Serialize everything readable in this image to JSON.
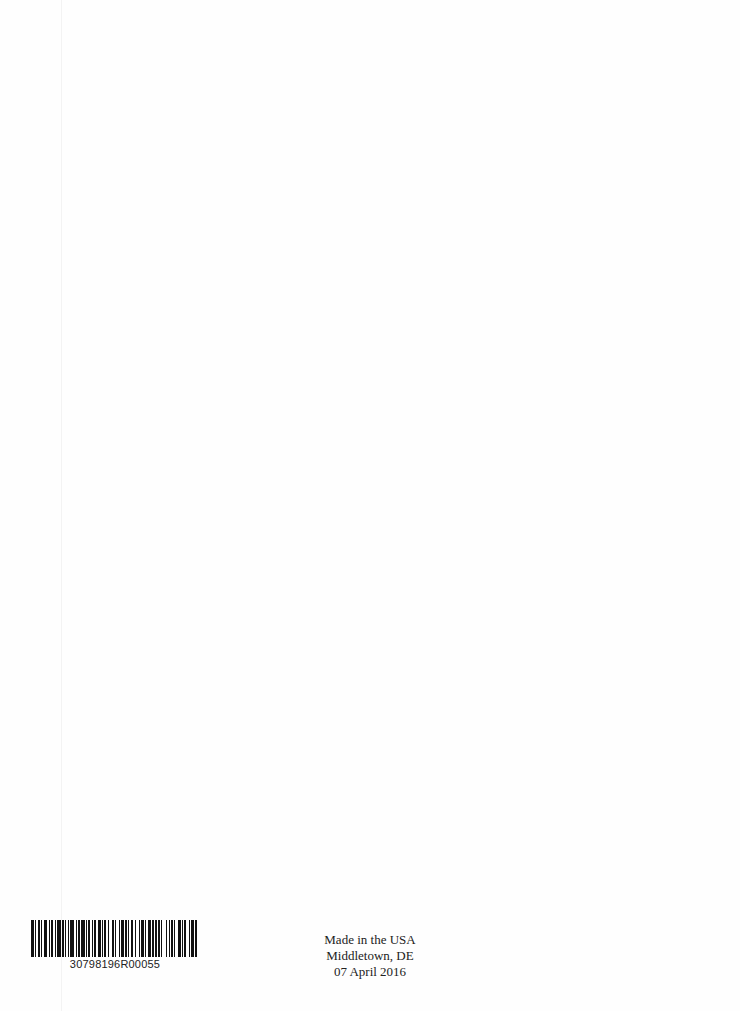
{
  "page": {
    "background": "#fefefe"
  },
  "barcode": {
    "number": "30798196R00055",
    "pattern": [
      3,
      1,
      1,
      1,
      2,
      1,
      1,
      2,
      3,
      1,
      1,
      1,
      2,
      2,
      1,
      1,
      3,
      1,
      2,
      1,
      1,
      2,
      1,
      1,
      3,
      2,
      1,
      1,
      2,
      1,
      3,
      1,
      1,
      1,
      2,
      2,
      1,
      1,
      1,
      2,
      3,
      1,
      1,
      1,
      2,
      1,
      1,
      3,
      2,
      1,
      1,
      2,
      1,
      1,
      3,
      1,
      2,
      1,
      1,
      1,
      2,
      2,
      1,
      3,
      1,
      1,
      2,
      1,
      1,
      2,
      3,
      1,
      1,
      1,
      2,
      1,
      2,
      1,
      1,
      3,
      1,
      2,
      1,
      1,
      2,
      1,
      1,
      2,
      3,
      1,
      1,
      1,
      2,
      2,
      1,
      1,
      3,
      1,
      2,
      1
    ]
  },
  "imprint": {
    "line1": "Made in the USA",
    "line2": "Middletown, DE",
    "line3": "07 April 2016"
  }
}
